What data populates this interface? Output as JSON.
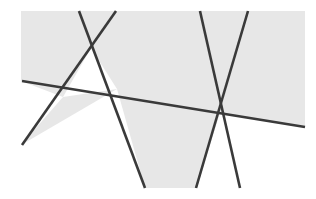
{
  "figure": {
    "type": "geometric-line-diagram",
    "caption": "",
    "width": 316,
    "height": 199,
    "background_color": "#ffffff",
    "shaded_color": "#e7e7e7",
    "line_color": "#3a3a3a",
    "line_width": 2.6
  },
  "shaded_region": {
    "name": "gray-rectangle",
    "x": 21,
    "y": 11,
    "width": 284,
    "height": 177,
    "fill": "#e7e7e7"
  },
  "white_regions": [
    {
      "name": "upper-triangle",
      "description": "white triangle between the two crossing lines and the near-horizontal line",
      "points": "91,48 117,89 63,97"
    },
    {
      "name": "lower-right-white-wedge",
      "description": "white area below the near-horizontal line right of the V vertex",
      "points": "220,113 305,127 305,188 196,188"
    },
    {
      "name": "lower-left-white-wedge",
      "description": "white area below the near-horizontal line left of the descending line",
      "points": "21,81 63,97 21,145"
    },
    {
      "name": "bottom-center-white-wedge",
      "description": "white gap between descending line and the V left arm",
      "points": "117,89 145,188 21,188 21,145"
    }
  ],
  "lines": [
    {
      "id": "line-1",
      "name": "near-horizontal-line",
      "label": "Horizontal transversal",
      "x1": 22,
      "y1": 81,
      "x2": 305,
      "y2": 127,
      "color": "#3a3a3a"
    },
    {
      "id": "line-2",
      "name": "left-descending-line",
      "label": "Left steep descending line",
      "x1": 79,
      "y1": 11,
      "x2": 145,
      "y2": 188,
      "color": "#3a3a3a"
    },
    {
      "id": "line-3",
      "name": "left-ascending-line",
      "label": "Left steep ascending line",
      "x1": 116,
      "y1": 11,
      "x2": 22,
      "y2": 145,
      "color": "#3a3a3a"
    },
    {
      "id": "line-4",
      "name": "right-descending-line",
      "label": "Right V left arm",
      "x1": 200,
      "y1": 11,
      "x2": 240,
      "y2": 188,
      "color": "#3a3a3a"
    },
    {
      "id": "line-5",
      "name": "right-ascending-line",
      "label": "Right V right arm",
      "x1": 248,
      "y1": 11,
      "x2": 196,
      "y2": 188,
      "color": "#3a3a3a"
    }
  ],
  "intersections": [
    {
      "name": "upper-left-crossing",
      "x": 91,
      "y": 48,
      "lines": [
        "line-2",
        "line-3"
      ]
    },
    {
      "name": "horizontal-left-crossing",
      "x": 63,
      "y": 97,
      "lines": [
        "line-1",
        "line-3"
      ]
    },
    {
      "name": "horizontal-mid-crossing",
      "x": 117,
      "y": 89,
      "lines": [
        "line-1",
        "line-2"
      ]
    },
    {
      "name": "right-triple-crossing",
      "x": 220,
      "y": 113,
      "lines": [
        "line-1",
        "line-4",
        "line-5"
      ]
    }
  ]
}
